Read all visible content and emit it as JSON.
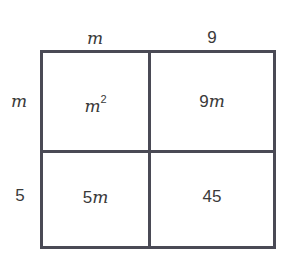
{
  "area_model": {
    "top_labels": [
      "m",
      "9"
    ],
    "side_labels": [
      "m",
      "5"
    ],
    "cells": [
      [
        "m²",
        "9m"
      ],
      [
        "5m",
        "45"
      ]
    ],
    "cell_parts": {
      "r0c0_base": "m",
      "r0c0_exp": "2",
      "r0c1_num": "9",
      "r0c1_var": "m",
      "r1c0_num": "5",
      "r1c0_var": "m",
      "r1c1": "45"
    },
    "border_color": "#4a4a55"
  }
}
